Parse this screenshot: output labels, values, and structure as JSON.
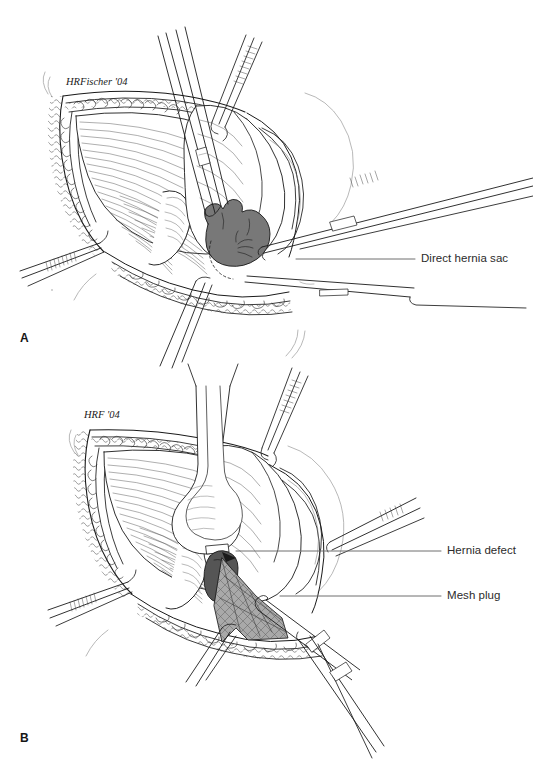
{
  "figure": {
    "background_color": "#ffffff",
    "line_color": "#1a1a1a",
    "ink_light": "#5a5a5a",
    "sac_fill": "#787878",
    "defect_fill": "#555555",
    "mesh_fill": "#a9a9a9",
    "label_color": "#2b2b2b"
  },
  "panels": [
    {
      "letter": "A",
      "signature": "HRFischer '04",
      "callouts": [
        {
          "text": "Direct hernia sac",
          "leader_y": 259
        }
      ]
    },
    {
      "letter": "B",
      "signature": "HRF '04",
      "callouts": [
        {
          "text": "Hernia defect",
          "leader_y": 551
        },
        {
          "text": "Mesh plug",
          "leader_y": 596
        }
      ]
    }
  ],
  "labels": {
    "panel_a_letter": "A",
    "panel_b_letter": "B",
    "signature_a": "HRFischer '04",
    "signature_b": "HRF '04",
    "direct_hernia_sac": "Direct hernia sac",
    "hernia_defect": "Hernia defect",
    "mesh_plug": "Mesh plug"
  }
}
